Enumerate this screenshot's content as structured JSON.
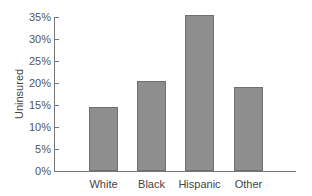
{
  "chart_data": {
    "type": "bar",
    "title": "",
    "xlabel": "",
    "ylabel": "Uninsured",
    "categories": [
      "White",
      "Black",
      "Hispanic",
      "Other"
    ],
    "values": [
      14.5,
      20.5,
      35.5,
      19.2
    ],
    "unit": "%",
    "ylim": [
      0,
      35
    ],
    "yticks": [
      "0%",
      "5%",
      "10%",
      "15%",
      "20%",
      "25%",
      "30%",
      "35%"
    ],
    "grid": false,
    "legend": null,
    "bar_color": "#8e8e8e"
  }
}
